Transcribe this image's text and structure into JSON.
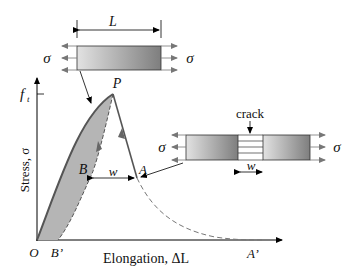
{
  "diagram": {
    "labels": {
      "length": "L",
      "sigma": "σ",
      "peak": "P",
      "tensile_strength": "f",
      "tensile_strength_sub": "t",
      "y_axis": "Stress, σ",
      "x_axis": "Elongation, ΔL",
      "origin": "O",
      "point_b": "B",
      "point_b_prime": "B’",
      "point_a": "A",
      "point_a_prime": "A’",
      "crack_width": "w",
      "crack": "crack"
    },
    "colors": {
      "curve": "#555555",
      "fill": "#b0b0b0",
      "axis": "#000000",
      "specimen_light": "#e0e0e0",
      "specimen_dark": "#808080"
    }
  }
}
